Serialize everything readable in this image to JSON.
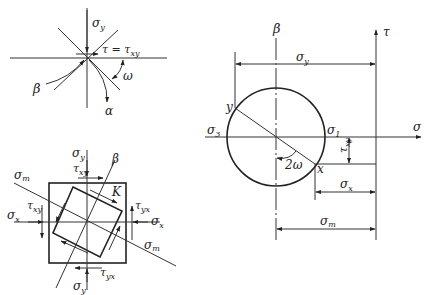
{
  "figure": {
    "top_left": {
      "labels": {
        "sigma_y": "σ",
        "sigma_y_sub": "y",
        "tau_eq": "τ = τ",
        "tau_eq_sub": "xy",
        "omega": "ω",
        "beta": "β",
        "alpha": "α"
      }
    },
    "bottom_left": {
      "labels": {
        "sigma_y_top": "σ",
        "sigma_y_top_sub": "y",
        "sigma_y_bottom": "σ",
        "sigma_y_bottom_sub": "y",
        "sigma_x_left": "σ",
        "sigma_x_left_sub": "x",
        "sigma_x_right": "σ",
        "sigma_x_right_sub": "x",
        "sigma_m_left": "σ",
        "sigma_m_left_sub": "m",
        "sigma_m_right": "σ",
        "sigma_m_right_sub": "m",
        "tau_xy_top": "τ",
        "tau_xy_top_sub": "xy",
        "tau_xy_left": "τ",
        "tau_xy_left_sub": "xy",
        "tau_yx_right": "τ",
        "tau_yx_right_sub": "yx",
        "tau_yx_bottom": "τ",
        "tau_yx_bottom_sub": "yx",
        "beta": "β",
        "k": "K"
      }
    },
    "mohr_circle": {
      "labels": {
        "beta": "β",
        "tau_axis": "τ",
        "sigma_axis": "σ",
        "sigma_y_dim": "σ",
        "sigma_y_dim_sub": "y",
        "sigma_3": "σ",
        "sigma_3_sub": "3",
        "sigma_1": "σ",
        "sigma_1_sub": "1",
        "point_y": "y",
        "point_x": "x",
        "two_omega": "2ω",
        "tau_xy_dim": "τ",
        "tau_xy_dim_sub": "xy",
        "sigma_x_dim": "σ",
        "sigma_x_dim_sub": "x",
        "sigma_m_dim": "σ",
        "sigma_m_dim_sub": "m"
      }
    }
  }
}
